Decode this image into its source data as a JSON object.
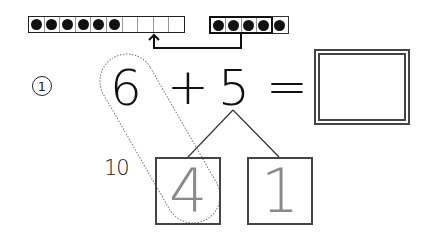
{
  "worksheet": {
    "problem_number": "1",
    "problem_number_display": "①",
    "ten_frame_left": {
      "cells": 10,
      "filled": 6
    },
    "ten_frame_right": {
      "cells": 5,
      "filled": 5
    },
    "equation": {
      "addend1": "6",
      "operator": "+",
      "addend2": "5",
      "equals": "=",
      "answer": ""
    },
    "number_bond": {
      "make_ten_label": "10",
      "left_part": "4",
      "right_part": "1"
    },
    "colors": {
      "ink": "#111111",
      "trace_gray": "#8a8a8a",
      "box_border": "#444444"
    }
  }
}
